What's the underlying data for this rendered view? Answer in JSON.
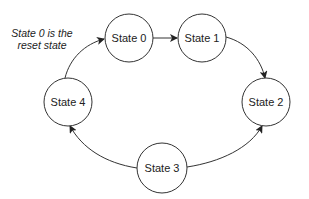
{
  "diagram": {
    "type": "state-machine",
    "note": {
      "line1": "State 0 is the",
      "line2": "reset state"
    },
    "states": [
      {
        "id": "s0",
        "label": "State 0"
      },
      {
        "id": "s1",
        "label": "State 1"
      },
      {
        "id": "s2",
        "label": "State 2"
      },
      {
        "id": "s3",
        "label": "State 3"
      },
      {
        "id": "s4",
        "label": "State 4"
      }
    ],
    "transitions": [
      {
        "from": "State 0",
        "to": "State 1"
      },
      {
        "from": "State 1",
        "to": "State 2"
      },
      {
        "from": "State 3",
        "to": "State 2"
      },
      {
        "from": "State 3",
        "to": "State 4"
      },
      {
        "from": "State 4",
        "to": "State 0"
      }
    ],
    "colors": {
      "stroke": "#333333",
      "fill": "#ffffff",
      "text": "#222222"
    }
  }
}
